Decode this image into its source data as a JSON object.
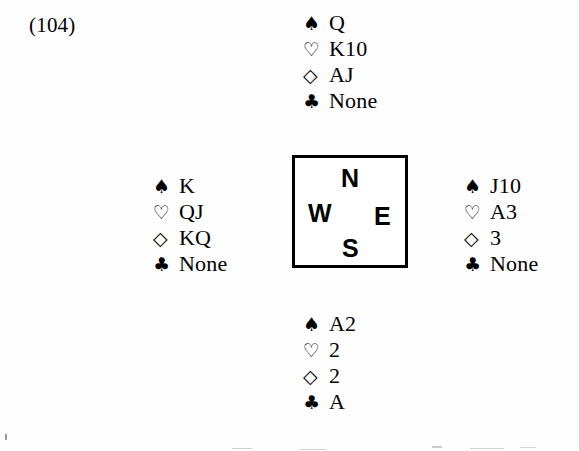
{
  "problem": {
    "label": "(104)"
  },
  "suits": {
    "spade_glyph": "♠",
    "heart_glyph": "♡",
    "diamond_glyph": "◇",
    "club_glyph": "♣",
    "spade_name": "spade-icon",
    "heart_name": "heart-icon",
    "diamond_name": "diamond-icon",
    "club_name": "club-icon"
  },
  "compass": {
    "north": "N",
    "west": "W",
    "east": "E",
    "south": "S"
  },
  "hands": {
    "north": {
      "position": "North",
      "spades": "Q",
      "hearts": "K10",
      "diamonds": "AJ",
      "clubs": "None"
    },
    "west": {
      "position": "West",
      "spades": "K",
      "hearts": "QJ",
      "diamonds": "KQ",
      "clubs": "None"
    },
    "east": {
      "position": "East",
      "spades": "J10",
      "hearts": "A3",
      "diamonds": "3",
      "clubs": "None"
    },
    "south": {
      "position": "South",
      "spades": "A2",
      "hearts": "2",
      "diamonds": "2",
      "clubs": "A"
    }
  }
}
